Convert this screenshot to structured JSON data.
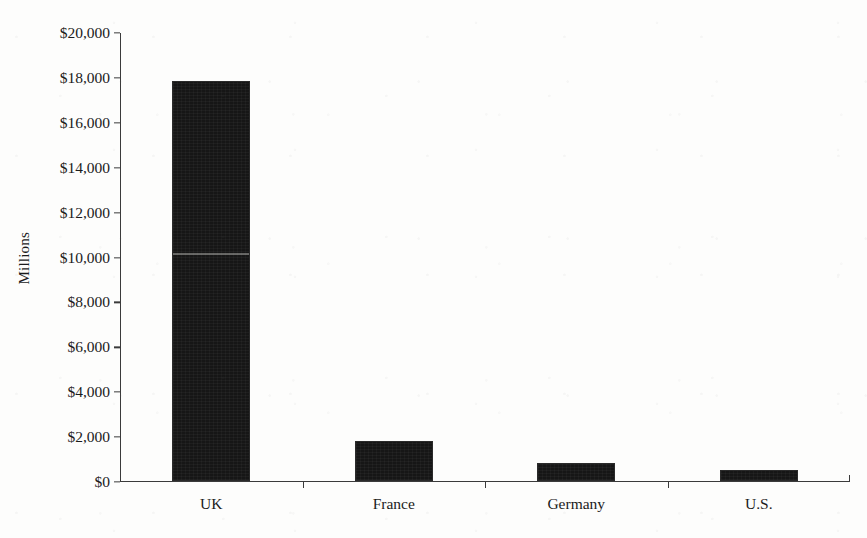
{
  "chart_data": {
    "type": "bar",
    "title": "",
    "subtitle": "",
    "xlabel": "",
    "ylabel": "Millions",
    "categories": [
      "UK",
      "France",
      "Germany",
      "U.S."
    ],
    "values": [
      17800,
      1800,
      800,
      500
    ],
    "series": [
      {
        "name": "",
        "values": [
          17800,
          1800,
          800,
          500
        ]
      }
    ],
    "ylim": [
      0,
      20000
    ],
    "ytick_values": [
      0,
      2000,
      4000,
      6000,
      8000,
      10000,
      12000,
      14000,
      16000,
      18000,
      20000
    ],
    "ytick_labels": [
      "$0",
      "$2,000",
      "$4,000",
      "$6,000",
      "$8,000",
      "$10,000",
      "$12,000",
      "$14,000",
      "$16,000",
      "$18,000",
      "$20,000"
    ],
    "grid": false,
    "legend": false,
    "legend_position": "none",
    "annotations": [],
    "bar_color": "#161616",
    "axis_color": "#3b3b3b",
    "background_color": "#fdfdfc"
  }
}
